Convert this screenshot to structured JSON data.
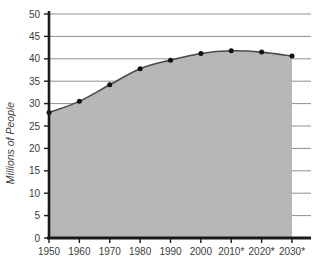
{
  "chart_data": {
    "type": "area",
    "title": "",
    "xlabel": "",
    "ylabel": "Millions of People",
    "x": [
      1950,
      1960,
      1970,
      1980,
      1990,
      2000,
      2010,
      2020,
      2030
    ],
    "categories": [
      "1950",
      "1960",
      "1970",
      "1980",
      "1990",
      "2000",
      "2010*",
      "2020*",
      "2030*"
    ],
    "values": [
      28.0,
      30.5,
      34.2,
      37.8,
      39.7,
      41.2,
      41.8,
      41.5,
      40.6
    ],
    "series": [
      {
        "name": "Millions of People",
        "values": [
          28.0,
          30.5,
          34.2,
          37.8,
          39.7,
          41.2,
          41.8,
          41.5,
          40.6
        ]
      }
    ],
    "ylim": [
      0,
      50
    ],
    "yticks": [
      0,
      5,
      10,
      15,
      20,
      25,
      30,
      35,
      40,
      45,
      50
    ],
    "ytick_labels": [
      "0",
      "5",
      "10",
      "15",
      "20",
      "25",
      "30",
      "35",
      "40",
      "45",
      "50"
    ],
    "xtick_labels": [
      "1950",
      "1960",
      "1970",
      "1980",
      "1990",
      "2000",
      "2010*",
      "2020*",
      "2030*"
    ],
    "grid": true,
    "grid_axis": "y",
    "legend": false,
    "legend_position": "none",
    "annotations": [
      "* denotes projected values"
    ],
    "colors": {
      "area_fill": "#b7b7b7",
      "line": "#4a4a4a",
      "marker": "#111111",
      "gridline": "#8f8f8f",
      "axis": "#1a1a1a",
      "text": "#3b3b3b",
      "background": "#ffffff"
    }
  }
}
